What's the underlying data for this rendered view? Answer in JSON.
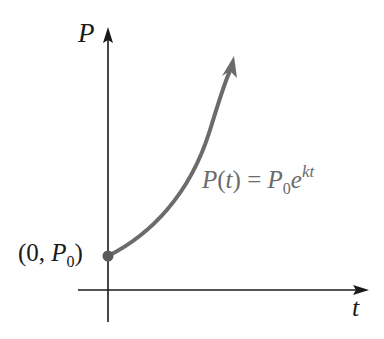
{
  "diagram": {
    "y_axis_label": "P",
    "x_axis_label": "t",
    "initial_point": {
      "open": "(0, ",
      "var": "P",
      "sub": "0",
      "close": ")"
    },
    "formula": {
      "lhs": "P(",
      "lhs_var": "t",
      "lhs_close": ") = P",
      "p_sub": "0",
      "base": "e",
      "exponent": "kt"
    },
    "colors": {
      "axis": "#1a1a1a",
      "curve": "#6b6b6b",
      "point": "#5a5a5a",
      "formula_text": "#6b6b6b"
    }
  }
}
